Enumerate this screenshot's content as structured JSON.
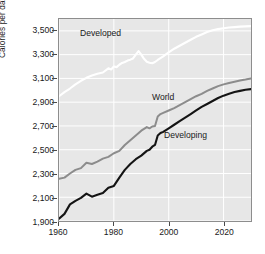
{
  "chart_data": {
    "type": "line",
    "title": "",
    "xlabel": "",
    "ylabel": "Calories per day per capita",
    "xlim": [
      1960,
      2030
    ],
    "ylim": [
      1900,
      3600
    ],
    "grid": true,
    "legend_position": "inline-annotations",
    "x_ticks": [
      1960,
      1980,
      2000,
      2020
    ],
    "x_tick_labels": [
      "1960",
      "1980",
      "2000",
      "2020"
    ],
    "y_ticks": [
      1900,
      2100,
      2300,
      2500,
      2700,
      2900,
      3100,
      3300,
      3500
    ],
    "y_tick_labels": [
      "1,900",
      "2,100",
      "2,300",
      "2,500",
      "2,700",
      "2,900",
      "3,100",
      "3,300",
      "3,500"
    ],
    "colors": {
      "developed": "#ffffff",
      "world": "#8c8c8c",
      "developing": "#141414",
      "plot_background": "#e7e7e7",
      "gridline": "#ffffff",
      "axis": "#8d8d8d",
      "text": "#1a1a1a"
    },
    "annotations": [
      {
        "text": "Developed",
        "x": 1968,
        "y": 3390
      },
      {
        "text": "World",
        "x": 1995,
        "y": 2890
      },
      {
        "text": "Developing",
        "x": 2000,
        "y": 2580
      }
    ],
    "series": [
      {
        "name": "Developed",
        "color": "#ffffff",
        "x": [
          1960,
          1962,
          1964,
          1966,
          1968,
          1970,
          1972,
          1974,
          1976,
          1978,
          1979,
          1980,
          1981,
          1982,
          1983,
          1984,
          1985,
          1986,
          1987,
          1988,
          1989,
          1990,
          1991,
          1992,
          1993,
          1994,
          1995,
          1996,
          1998,
          2000,
          2002,
          2004,
          2006,
          2008,
          2010,
          2012,
          2014,
          2016,
          2018,
          2020,
          2022,
          2024,
          2026,
          2028,
          2030
        ],
        "values": [
          2950,
          2985,
          3015,
          3050,
          3080,
          3105,
          3125,
          3140,
          3150,
          3185,
          3175,
          3200,
          3195,
          3215,
          3230,
          3238,
          3250,
          3258,
          3268,
          3300,
          3330,
          3300,
          3265,
          3240,
          3232,
          3228,
          3238,
          3255,
          3285,
          3320,
          3350,
          3375,
          3400,
          3425,
          3450,
          3470,
          3490,
          3505,
          3515,
          3522,
          3528,
          3532,
          3536,
          3538,
          3540
        ]
      },
      {
        "name": "World",
        "color": "#8c8c8c",
        "x": [
          1960,
          1962,
          1964,
          1966,
          1968,
          1970,
          1972,
          1974,
          1976,
          1978,
          1980,
          1982,
          1984,
          1986,
          1988,
          1990,
          1992,
          1993,
          1994,
          1995,
          1996,
          1997,
          1998,
          2000,
          2002,
          2004,
          2006,
          2008,
          2010,
          2012,
          2014,
          2016,
          2018,
          2020,
          2022,
          2024,
          2026,
          2028,
          2030
        ],
        "values": [
          2255,
          2265,
          2300,
          2330,
          2345,
          2390,
          2380,
          2400,
          2425,
          2440,
          2470,
          2490,
          2540,
          2580,
          2620,
          2660,
          2690,
          2680,
          2695,
          2700,
          2780,
          2800,
          2810,
          2830,
          2850,
          2875,
          2900,
          2925,
          2950,
          2970,
          2995,
          3015,
          3035,
          3050,
          3062,
          3072,
          3082,
          3090,
          3100
        ]
      },
      {
        "name": "Developing",
        "color": "#141414",
        "x": [
          1960,
          1962,
          1964,
          1966,
          1968,
          1970,
          1972,
          1974,
          1976,
          1978,
          1980,
          1982,
          1984,
          1986,
          1988,
          1990,
          1992,
          1993,
          1994,
          1995,
          1996,
          1997,
          1998,
          2000,
          2002,
          2004,
          2006,
          2008,
          2010,
          2012,
          2014,
          2016,
          2018,
          2020,
          2022,
          2024,
          2026,
          2028,
          2030
        ],
        "values": [
          1920,
          1960,
          2040,
          2070,
          2095,
          2130,
          2105,
          2120,
          2135,
          2180,
          2195,
          2265,
          2330,
          2380,
          2420,
          2450,
          2490,
          2500,
          2525,
          2540,
          2620,
          2640,
          2650,
          2680,
          2710,
          2740,
          2770,
          2800,
          2830,
          2860,
          2885,
          2910,
          2935,
          2955,
          2970,
          2985,
          2995,
          3005,
          3010
        ]
      }
    ]
  }
}
